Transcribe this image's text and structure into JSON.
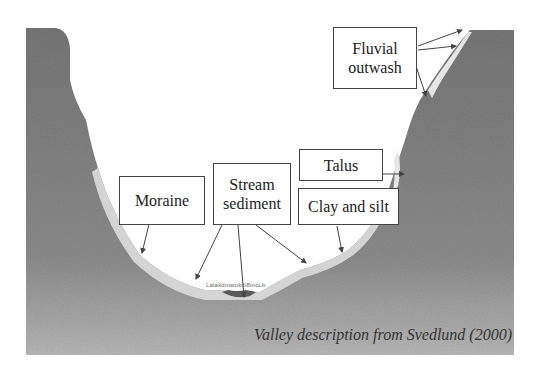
{
  "diagram": {
    "type": "cross-section",
    "labels": {
      "fluvial_outwash": "Fluvial\noutwash",
      "fluvial_outwash_line1": "Fluvial",
      "fluvial_outwash_line2": "outwash",
      "moraine": "Moraine",
      "stream_sediment_line1": "Stream",
      "stream_sediment_line2": "sediment",
      "talus": "Talus",
      "clay_and_silt": "Clay and silt"
    },
    "small_text": "Lalakdmwukdi8mcLb",
    "caption": "Valley description from Svedlund (2000)",
    "colors": {
      "bedrock": "#7d7d7d",
      "bedrock_light": "#a9a9a9",
      "sediment": "#d9d9d9",
      "valley_air": "#ffffff",
      "box_border": "#444444",
      "text": "#222222"
    }
  }
}
